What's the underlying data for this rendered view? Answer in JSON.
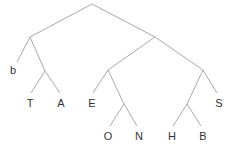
{
  "diagram": {
    "type": "tree",
    "edge_color": "#a9a9a9",
    "label_color": "#333333",
    "nodes": {
      "root": {
        "x": 92,
        "y": 4
      },
      "n1": {
        "x": 30,
        "y": 37
      },
      "n2": {
        "x": 155,
        "y": 37
      },
      "n3": {
        "x": 45,
        "y": 71
      },
      "n4": {
        "x": 108,
        "y": 70
      },
      "n5": {
        "x": 203,
        "y": 70
      },
      "n6": {
        "x": 124,
        "y": 104
      },
      "n7": {
        "x": 187,
        "y": 104
      }
    },
    "leaves": [
      {
        "id": "b",
        "label": "b",
        "x": 13,
        "y": 70,
        "edge_end": [
          17,
          62
        ]
      },
      {
        "id": "T",
        "label": "T",
        "x": 30,
        "y": 103,
        "edge_end": [
          31,
          93
        ]
      },
      {
        "id": "A",
        "label": "A",
        "x": 61,
        "y": 103,
        "edge_end": [
          60,
          93
        ]
      },
      {
        "id": "E",
        "label": "E",
        "x": 92,
        "y": 103,
        "edge_end": [
          93,
          93
        ]
      },
      {
        "id": "O",
        "label": "O",
        "x": 108,
        "y": 136,
        "edge_end": [
          110,
          126
        ]
      },
      {
        "id": "N",
        "label": "N",
        "x": 139,
        "y": 136,
        "edge_end": [
          137,
          126
        ]
      },
      {
        "id": "H",
        "label": "H",
        "x": 172,
        "y": 136,
        "edge_end": [
          173,
          126
        ]
      },
      {
        "id": "B",
        "label": "B",
        "x": 203,
        "y": 136,
        "edge_end": [
          201,
          126
        ]
      },
      {
        "id": "S",
        "label": "S",
        "x": 219,
        "y": 103,
        "edge_end": [
          217,
          93
        ]
      }
    ],
    "edges": [
      {
        "from": "root",
        "to": "n1"
      },
      {
        "from": "root",
        "to": "n2"
      },
      {
        "from": "n1",
        "to": "leaf:b"
      },
      {
        "from": "n1",
        "to": "n3"
      },
      {
        "from": "n3",
        "to": "leaf:T"
      },
      {
        "from": "n3",
        "to": "leaf:A"
      },
      {
        "from": "n2",
        "to": "n4"
      },
      {
        "from": "n2",
        "to": "n5"
      },
      {
        "from": "n4",
        "to": "leaf:E"
      },
      {
        "from": "n4",
        "to": "n6"
      },
      {
        "from": "n6",
        "to": "leaf:O"
      },
      {
        "from": "n6",
        "to": "leaf:N"
      },
      {
        "from": "n5",
        "to": "n7"
      },
      {
        "from": "n5",
        "to": "leaf:S"
      },
      {
        "from": "n7",
        "to": "leaf:H"
      },
      {
        "from": "n7",
        "to": "leaf:B"
      }
    ]
  }
}
